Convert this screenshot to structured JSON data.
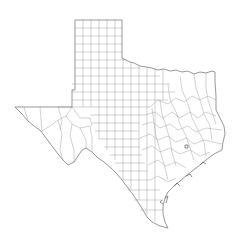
{
  "map": {
    "subject": "Texas county boundaries",
    "style": "outline line drawing",
    "colors": {
      "background": "#ffffff",
      "border": "#6a6a6a",
      "county_lines": "#9a9a9a"
    }
  }
}
